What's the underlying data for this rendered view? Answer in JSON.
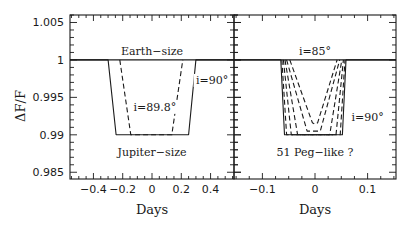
{
  "chart_data": [
    {
      "type": "line",
      "panel": "left",
      "title": "",
      "xlabel": "Days",
      "ylabel": "ΔF/F",
      "xlim": [
        -0.56,
        0.56
      ],
      "ylim": [
        0.9841,
        1.006
      ],
      "xticks": [
        -0.4,
        -0.2,
        0,
        0.2,
        0.4
      ],
      "xtick_labels": [
        "−0.4",
        "−0.2",
        "0",
        "0.2",
        "0.4"
      ],
      "yticks": [
        0.985,
        0.99,
        0.995,
        1,
        1.005
      ],
      "ytick_labels": [
        "0.985",
        "0.99",
        "0.995",
        "1",
        "1.005"
      ],
      "grid": false,
      "annotations": [
        {
          "text": "Earth−size",
          "x": 0,
          "y": 1.0007
        },
        {
          "text": "i=90°",
          "x": 0.41,
          "y": 0.9968
        },
        {
          "text": "i=89.8°",
          "x": 0.02,
          "y": 0.9932
        },
        {
          "text": "Jupiter−size",
          "x": 0,
          "y": 0.9872
        }
      ],
      "series": [
        {
          "name": "Earth-size",
          "style": "solid",
          "x": [
            -0.56,
            0.56
          ],
          "y": [
            1.0,
            1.0
          ]
        },
        {
          "name": "Jupiter-size i=90°",
          "style": "solid",
          "x": [
            -0.56,
            -0.3,
            -0.245,
            0.25,
            0.3,
            0.56
          ],
          "y": [
            1.0,
            1.0,
            0.99,
            0.99,
            1.0,
            1.0
          ]
        },
        {
          "name": "Jupiter-size i=89.8°",
          "style": "dashed",
          "x": [
            -0.22,
            -0.145,
            0.135,
            0.21
          ],
          "y": [
            1.0,
            0.99,
            0.99,
            1.0
          ]
        }
      ]
    },
    {
      "type": "line",
      "panel": "right",
      "title": "",
      "xlabel": "Days",
      "ylabel": "",
      "xlim": [
        -0.154,
        0.154
      ],
      "ylim": [
        0.9841,
        1.006
      ],
      "xticks": [
        -0.1,
        0,
        0.1
      ],
      "xtick_labels": [
        "−0.1",
        "0",
        "0.1"
      ],
      "grid": false,
      "annotations": [
        {
          "text": "i=85°",
          "x": 0.0,
          "y": 1.0007
        },
        {
          "text": "i=90°",
          "x": 0.1,
          "y": 0.9918
        },
        {
          "text": "51 Peg−like ?",
          "x": 0.0,
          "y": 0.9872
        }
      ],
      "series": [
        {
          "name": "baseline",
          "style": "solid",
          "x": [
            -0.154,
            0.154
          ],
          "y": [
            1.0,
            1.0
          ]
        },
        {
          "name": "i=90°",
          "style": "solid",
          "x": [
            -0.154,
            -0.065,
            -0.058,
            0.052,
            0.059,
            0.154
          ],
          "y": [
            1.0,
            1.0,
            0.99,
            0.99,
            1.0,
            1.0
          ]
        },
        {
          "name": "i=89°",
          "style": "dashed",
          "x": [
            -0.063,
            -0.054,
            0.048,
            0.057
          ],
          "y": [
            1.0,
            0.99,
            0.99,
            1.0
          ]
        },
        {
          "name": "i=88°",
          "style": "dashed",
          "x": [
            -0.06,
            -0.045,
            0.04,
            0.054
          ],
          "y": [
            1.0,
            0.99,
            0.99,
            1.0
          ]
        },
        {
          "name": "i=87°",
          "style": "dashed",
          "x": [
            -0.057,
            -0.033,
            0.028,
            0.051
          ],
          "y": [
            1.0,
            0.99,
            0.99,
            1.0
          ]
        },
        {
          "name": "i=86°",
          "style": "dashed",
          "x": [
            -0.054,
            -0.015,
            0.01,
            0.047
          ],
          "y": [
            1.0,
            0.9905,
            0.9905,
            1.0
          ]
        },
        {
          "name": "i=85°",
          "style": "dashed",
          "x": [
            -0.048,
            -0.005,
            0.0,
            0.005,
            0.042
          ],
          "y": [
            1.0,
            0.9916,
            0.9914,
            0.9916,
            1.0
          ]
        }
      ]
    }
  ],
  "labels": {
    "ylabel": "ΔF/F",
    "left_xlabel": "Days",
    "right_xlabel": "Days"
  }
}
